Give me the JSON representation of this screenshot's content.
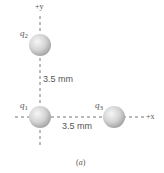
{
  "figure": {
    "caption_open": "(",
    "caption_letter": "a",
    "caption_close": ")",
    "axes": {
      "x_label": "+x",
      "y_label": "+y"
    },
    "charges": [
      {
        "symbol": "q",
        "index": "2",
        "position": "on +y axis, above q1"
      },
      {
        "symbol": "q",
        "index": "1",
        "position": "origin"
      },
      {
        "symbol": "q",
        "index": "3",
        "position": "on +x axis, right of q1"
      }
    ],
    "distances": {
      "q1_q2": "3.5 mm",
      "q1_q3": "3.5 mm"
    },
    "colors": {
      "axis": "#666666",
      "sphere_light": "#f4f4f4",
      "sphere_mid": "#cfcfcf",
      "sphere_dark": "#9c9c9c",
      "text": "#555555"
    }
  }
}
